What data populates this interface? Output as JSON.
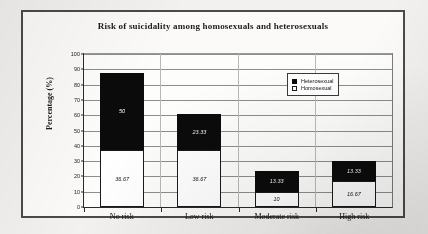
{
  "chart_data": {
    "type": "bar",
    "title": "Risk of suicidality among homosexuals and heterosexuals",
    "xlabel": "",
    "ylabel": "Percentage (%)",
    "ylim": [
      0,
      100
    ],
    "ytick_step": 10,
    "yticks": [
      "100",
      "90",
      "80",
      "70",
      "60",
      "50",
      "40",
      "30",
      "20",
      "10",
      "0"
    ],
    "grid": true,
    "stacked": true,
    "legend_position": "top-right-inside",
    "categories": [
      "No risk",
      "Low risk",
      "Moderate risk",
      "High risk"
    ],
    "series": [
      {
        "name": "Homosexual",
        "color": "#ffffff",
        "values": [
          36.67,
          36.67,
          10,
          16.67
        ],
        "labels": [
          "36.67",
          "36.67",
          "10",
          "16.67"
        ]
      },
      {
        "name": "Heterosexual",
        "color": "#0b0b0b",
        "values": [
          50,
          23.33,
          13.33,
          13.33
        ],
        "labels": [
          "50",
          "23.33",
          "13.33",
          "13.33"
        ]
      }
    ]
  },
  "legend": {
    "entries": [
      {
        "label": "Heterosexual",
        "swatch": "filled-black-square"
      },
      {
        "label": "Homosexual",
        "swatch": "outlined-white-square"
      }
    ]
  }
}
